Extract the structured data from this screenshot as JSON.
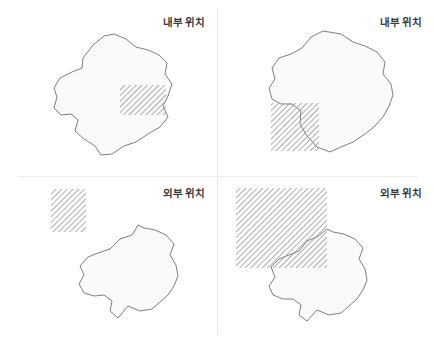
{
  "figure": {
    "width": 434,
    "height": 342,
    "background": "#ffffff",
    "layout": "2x2 panel grid",
    "divider_color": "#e3e5e7"
  },
  "colors": {
    "blob_fill": "#fafafa",
    "blob_stroke": "#7c7f83",
    "hatch_line": "#9a9a9a",
    "label_text": "#3b3b3b",
    "divider": "#e3e5e7"
  },
  "panels": [
    {
      "id": "panel-top-left",
      "label": "내부 위치",
      "relation": "rectangle fully inside blob",
      "blob": {
        "name": "irregular-region",
        "points": "104,36 93,45 83,58 82,68 72,72 60,78 54,88 57,97 54,108 61,115 71,114 78,120 75,131 84,139 95,146 101,155 112,154 124,146 136,142 148,134 160,127 168,117 163,106 168,96 172,84 165,74 167,63 159,55 148,50 136,47 126,39 114,34"
      },
      "rectangle": {
        "name": "hatched-rectangle",
        "x": 120,
        "y": 85,
        "width": 46,
        "height": 30
      }
    },
    {
      "id": "panel-top-right",
      "label": "내부 위치",
      "relation": "rectangle partially overlapping blob edge",
      "blob": {
        "name": "irregular-region",
        "points": "106,31 94,37 85,48 74,54 62,58 55,68 58,79 52,88 55,99 64,104 75,104 84,111 83,124 90,136 100,147 113,152 124,147 136,142 148,134 158,126 166,117 172,106 176,95 174,84 166,74 168,62 160,52 148,46 136,42 124,34"
      },
      "rectangle": {
        "name": "hatched-rectangle",
        "x": 54,
        "y": 103,
        "width": 48,
        "height": 48
      }
    },
    {
      "id": "panel-bottom-left",
      "label": "외부 위치",
      "relation": "rectangle entirely outside blob, separated",
      "blob": {
        "name": "irregular-region",
        "points": "132,64 120,68 110,78 98,82 88,86 80,95 84,104 79,113 84,122 94,125 104,124 112,130 110,140 118,147 128,135 140,140 152,138 160,131 168,124 174,115 178,105 176,94 170,84 174,73 166,64 155,59 144,57 138,54"
      },
      "rectangle": {
        "name": "hatched-rectangle",
        "x": 51,
        "y": 18,
        "width": 35,
        "height": 43
      }
    },
    {
      "id": "panel-bottom-right",
      "label": "외부 위치",
      "relation": "large rectangle overlapping blob corner from outside",
      "blob": {
        "name": "irregular-region",
        "points": "100,66 90,70 82,80 72,84 62,88 54,96 58,106 52,115 56,124 66,128 76,128 84,134 82,144 90,150 100,139 112,144 124,142 132,135 140,128 146,119 150,109 148,98 142,88 146,77 138,68 127,63 116,61 110,58"
      },
      "rectangle": {
        "name": "hatched-rectangle",
        "x": 19,
        "y": 17,
        "width": 91,
        "height": 80
      }
    }
  ]
}
